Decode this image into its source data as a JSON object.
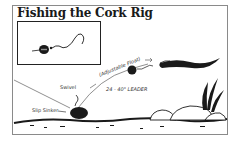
{
  "diagram": {
    "title": "Fishing the Cork Rig",
    "labels": {
      "swivel": "Swivel",
      "slip_sinker": "Slip Sinker",
      "float": "(Adjustable Float)",
      "leader": "24 - 40\" LEADER"
    },
    "colors": {
      "ink": "#1a1a1a",
      "frame": "#8a8a8a",
      "background": "#ffffff"
    }
  }
}
